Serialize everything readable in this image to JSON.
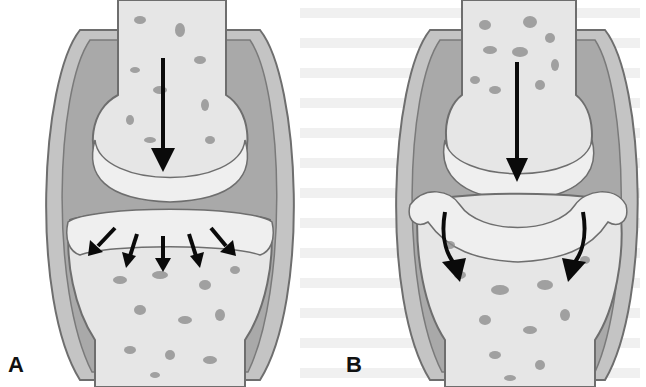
{
  "figure": {
    "panels": [
      {
        "label": "A",
        "description": "Joint with load distributed across articular surface",
        "arrows": "one vertical arrow above, five radiating arrows below"
      },
      {
        "label": "B",
        "description": "Joint with incongruent surfaces; load concentrated at edges",
        "arrows": "one vertical arrow above, two curved arrows at edges"
      }
    ]
  },
  "colors": {
    "bone": "#e6e6e6",
    "capsule": "#b8b8b8",
    "cartilage": "#efefef",
    "outline": "#6e6e6e",
    "pores": "#8a8a8a",
    "arrow": "#0a0a0a"
  }
}
